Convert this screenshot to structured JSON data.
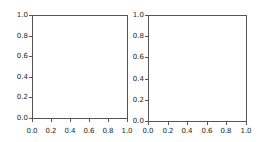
{
  "figure": {
    "background": "#ffffff",
    "spine_color": "#555555",
    "tick_color": "#555555",
    "text_color": "#262626"
  },
  "chart_data": [
    {
      "id": "left-subplot",
      "type": "line",
      "title": "",
      "xlabel": "",
      "ylabel": "",
      "xlim": [
        0.0,
        1.0
      ],
      "ylim": [
        0.0,
        1.0
      ],
      "xticks": [
        "0.0",
        "0.2",
        "0.4",
        "0.6",
        "0.8",
        "1.0"
      ],
      "yticks": [
        "0.0",
        "0.2",
        "0.4",
        "0.6",
        "0.8",
        "1.0"
      ],
      "grid": false,
      "legend": false,
      "series": []
    },
    {
      "id": "right-subplot",
      "type": "line",
      "title": "",
      "xlabel": "",
      "ylabel": "",
      "xlim": [
        0.0,
        1.0
      ],
      "ylim": [
        0.0,
        1.0
      ],
      "xticks": [
        "0.0",
        "0.2",
        "0.4",
        "0.6",
        "0.8",
        "1.0"
      ],
      "yticks": [
        "0.0",
        "0.2",
        "0.4",
        "0.6",
        "0.8",
        "1.0"
      ],
      "grid": false,
      "legend": false,
      "series": []
    }
  ]
}
